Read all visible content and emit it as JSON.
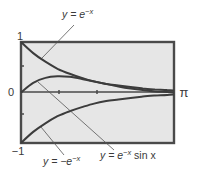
{
  "chart_data": {
    "type": "line",
    "title": "",
    "xlabel": "",
    "ylabel": "",
    "xlim": [
      0,
      3.14159
    ],
    "ylim": [
      -1,
      1
    ],
    "grid": false,
    "legend": "none (curves labeled with leader lines)",
    "y_tick_labels": [
      "1",
      "0",
      "-1"
    ],
    "x_tick_labels": [
      "π"
    ],
    "x_minor_ticks": [
      1,
      2
    ],
    "y_minor_ticks": [
      0.5,
      -0.5
    ],
    "series": [
      {
        "name": "y = e^{-x}",
        "label_parts": {
          "base": "y = e",
          "sup": "−x"
        },
        "x": [
          0,
          0.25,
          0.5,
          0.75,
          1.0,
          1.25,
          1.5,
          1.75,
          2.0,
          2.25,
          2.5,
          2.75,
          3.0,
          3.14
        ],
        "values": [
          1.0,
          0.78,
          0.61,
          0.47,
          0.37,
          0.29,
          0.22,
          0.17,
          0.14,
          0.11,
          0.08,
          0.06,
          0.05,
          0.04
        ]
      },
      {
        "name": "y = e^{-x} sin x",
        "label_parts": {
          "base": "y = e",
          "sup": "−x",
          "tail": " sin x"
        },
        "x": [
          0,
          0.25,
          0.5,
          0.75,
          1.0,
          1.25,
          1.5,
          1.75,
          2.0,
          2.25,
          2.5,
          2.75,
          3.0,
          3.14
        ],
        "values": [
          0.0,
          0.19,
          0.29,
          0.32,
          0.31,
          0.27,
          0.22,
          0.17,
          0.12,
          0.08,
          0.05,
          0.02,
          0.01,
          0.0
        ]
      },
      {
        "name": "y = -e^{-x}",
        "label_parts": {
          "base": "y = −e",
          "sup": "−x"
        },
        "x": [
          0,
          0.25,
          0.5,
          0.75,
          1.0,
          1.25,
          1.5,
          1.75,
          2.0,
          2.25,
          2.5,
          2.75,
          3.0,
          3.14
        ],
        "values": [
          -1.0,
          -0.78,
          -0.61,
          -0.47,
          -0.37,
          -0.29,
          -0.22,
          -0.17,
          -0.14,
          -0.11,
          -0.08,
          -0.06,
          -0.05,
          -0.04
        ]
      }
    ]
  },
  "axis_labels": {
    "y_top": "1",
    "y_zero": "0",
    "y_bottom": "−1",
    "x_right": "π"
  },
  "colors": {
    "plot_bg": "#e6e6e6",
    "frame": "#4a4a4a",
    "curve": "#3c3c3c",
    "leader": "#555555",
    "text": "#3a3a3a"
  }
}
